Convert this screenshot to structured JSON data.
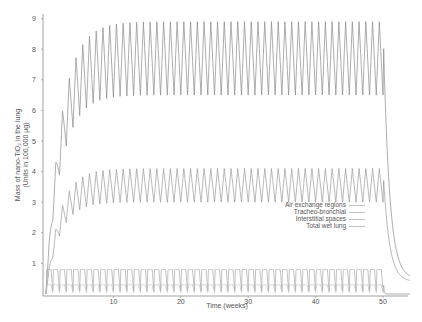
{
  "chart_data": {
    "type": "line",
    "title": "",
    "xlabel": "Time (weeks)",
    "ylabel_line1": "Mass of nano-TiO₂ in the lung",
    "ylabel_line2": "(Units in 100,000 µg)",
    "xlim": [
      0,
      54
    ],
    "ylim": [
      0,
      9
    ],
    "x_ticks": [
      10,
      20,
      30,
      40,
      50
    ],
    "y_ticks": [
      1,
      2,
      3,
      4,
      5,
      6,
      7,
      8,
      9
    ],
    "grid": false,
    "legend_position": "center-right",
    "legend": [
      "Air exchange regions",
      "Tracheo-bronchial",
      "Interstitial spaces",
      "Total wet lung"
    ],
    "exposure_period_weeks": 50,
    "cycle_period_weeks": 1,
    "series": [
      {
        "name": "Total wet lung",
        "steady_state_min": 6.5,
        "steady_state_max": 8.9,
        "start": 0,
        "post_exposure_decay_to": 0.5,
        "color": "#8a8a8a"
      },
      {
        "name": "Interstitial spaces",
        "steady_state_min": 3.0,
        "steady_state_max": 4.1,
        "start": 0,
        "post_exposure_decay_to": 0.4,
        "color": "#9a9a9a"
      },
      {
        "name": "Air exchange regions",
        "steady_state_min": 0.1,
        "steady_state_max": 0.8,
        "start": 0,
        "post_exposure_decay_to": 0.0,
        "color": "#a8a8a8"
      },
      {
        "name": "Tracheo-bronchial",
        "steady_state_min": 0.05,
        "steady_state_max": 0.3,
        "start": 0,
        "post_exposure_decay_to": 0.0,
        "color": "#c0c0c0"
      }
    ]
  }
}
